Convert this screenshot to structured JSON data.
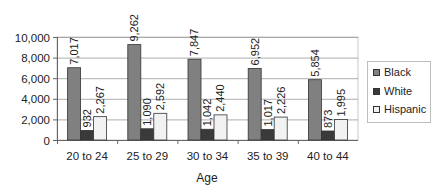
{
  "chart_data": {
    "type": "bar",
    "title": "",
    "xlabel": "Age",
    "ylabel": "",
    "categories": [
      "20 to 24",
      "25 to 29",
      "30 to 34",
      "35 to 39",
      "40 to 44"
    ],
    "series": [
      {
        "name": "Black",
        "color": "#808080",
        "values": [
          7017,
          9262,
          7847,
          6952,
          5854
        ],
        "labels": [
          "7,017",
          "9,262",
          "7,847",
          "6,952",
          "5,854"
        ]
      },
      {
        "name": "White",
        "color": "#3a3a3a",
        "values": [
          932,
          1090,
          1042,
          1017,
          873
        ],
        "labels": [
          "932",
          "1,090",
          "1,042",
          "1,017",
          "873"
        ]
      },
      {
        "name": "Hispanic",
        "color": "#f2f2f2",
        "values": [
          2267,
          2592,
          2440,
          2226,
          1995
        ],
        "labels": [
          "2,267",
          "2,592",
          "2,440",
          "2,226",
          "1,995"
        ]
      }
    ],
    "ylim": [
      0,
      10000
    ],
    "yticks": [
      0,
      2000,
      4000,
      6000,
      8000,
      10000
    ],
    "ytick_labels": [
      "0",
      "2,000",
      "4,000",
      "6,000",
      "8,000",
      "10,000"
    ],
    "grid": true,
    "legend_position": "right",
    "data_labels": "rotated vertical above bars"
  },
  "legend": {
    "items": [
      {
        "label": "Black",
        "color": "#808080"
      },
      {
        "label": "White",
        "color": "#3a3a3a"
      },
      {
        "label": "Hispanic",
        "color": "#f2f2f2"
      }
    ]
  }
}
